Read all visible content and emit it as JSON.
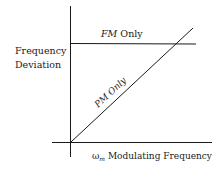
{
  "diagram": {
    "y_axis_label_line1": "Frequency",
    "y_axis_label_line2": "Deviation",
    "x_axis_label_symbol": "ω",
    "x_axis_label_subscript": "m",
    "x_axis_label_text": " Modulating Frequency",
    "fm_line_label_italic": "FM",
    "fm_line_label_rest": " Only",
    "pm_line_label": "PM Only",
    "colors": {
      "line": "#1a1a1a",
      "background": "#ffffff"
    }
  }
}
